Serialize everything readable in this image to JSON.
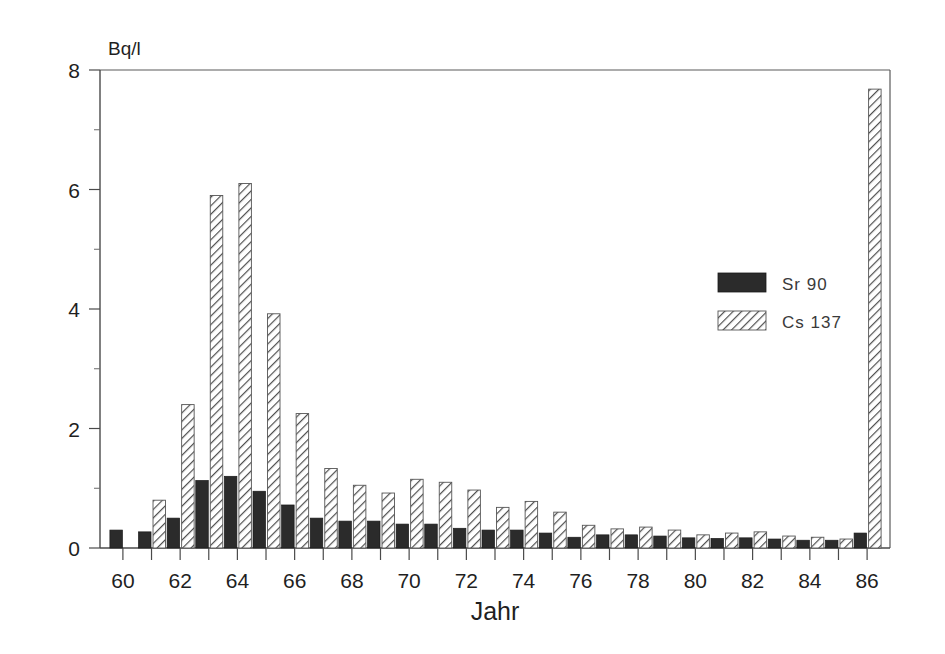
{
  "chart_data": {
    "type": "bar",
    "title": "",
    "subtitle": "",
    "xlabel": "Jahr",
    "ylabel": "Bq/l",
    "unit_label": "Bq/l",
    "grid": false,
    "legend_position": "inside-right-upper",
    "xlim": [
      59.2,
      86.8
    ],
    "ylim": [
      0,
      8
    ],
    "y_ticks": [
      0,
      2,
      4,
      6,
      8
    ],
    "y_ticklabels": [
      "0",
      "2",
      "4",
      "6",
      "8"
    ],
    "y_minor_ticks": [
      1,
      3,
      5,
      7
    ],
    "x_ticks": [
      60,
      61,
      62,
      63,
      64,
      65,
      66,
      67,
      68,
      69,
      70,
      71,
      72,
      73,
      74,
      75,
      76,
      77,
      78,
      79,
      80,
      81,
      82,
      83,
      84,
      85,
      86
    ],
    "x_ticklabels_shown": [
      "60",
      "62",
      "64",
      "66",
      "68",
      "70",
      "72",
      "74",
      "76",
      "78",
      "80",
      "82",
      "84",
      "86"
    ],
    "categories": [
      60,
      61,
      62,
      63,
      64,
      65,
      66,
      67,
      68,
      69,
      70,
      71,
      72,
      73,
      74,
      75,
      76,
      77,
      78,
      79,
      80,
      81,
      82,
      83,
      84,
      85,
      86
    ],
    "series": [
      {
        "name": "Sr 90",
        "style": "solid",
        "color": "#2b2b2b",
        "values": [
          0.3,
          0.27,
          0.5,
          1.13,
          1.2,
          0.95,
          0.72,
          0.5,
          0.45,
          0.45,
          0.4,
          0.4,
          0.33,
          0.3,
          0.3,
          0.25,
          0.18,
          0.22,
          0.22,
          0.2,
          0.17,
          0.16,
          0.17,
          0.15,
          0.13,
          0.13,
          0.25
        ]
      },
      {
        "name": "Cs 137",
        "style": "hatched",
        "color": "#ffffff",
        "values": [
          0.0,
          0.8,
          2.4,
          5.9,
          6.1,
          3.92,
          2.25,
          1.33,
          1.05,
          0.92,
          1.15,
          1.1,
          0.97,
          0.68,
          0.78,
          0.6,
          0.38,
          0.32,
          0.35,
          0.3,
          0.22,
          0.25,
          0.27,
          0.2,
          0.18,
          0.15,
          7.68
        ]
      }
    ]
  },
  "legend": {
    "items": [
      {
        "label": "Sr 90",
        "style": "solid"
      },
      {
        "label": "Cs 137",
        "style": "hatched"
      }
    ]
  },
  "axis": {
    "unit": "Bq/l",
    "x_title": "Jahr"
  }
}
